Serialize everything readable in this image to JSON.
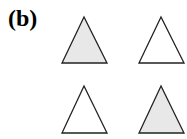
{
  "panel_label": "(b)",
  "colors": {
    "shaded_fill": "#e8e8e8",
    "unshaded_fill": "#ffffff",
    "stroke": "#222222"
  },
  "triangles": [
    {
      "position": "top-left",
      "shaded": true
    },
    {
      "position": "top-right",
      "shaded": false
    },
    {
      "position": "bottom-left",
      "shaded": false
    },
    {
      "position": "bottom-right",
      "shaded": true
    }
  ]
}
